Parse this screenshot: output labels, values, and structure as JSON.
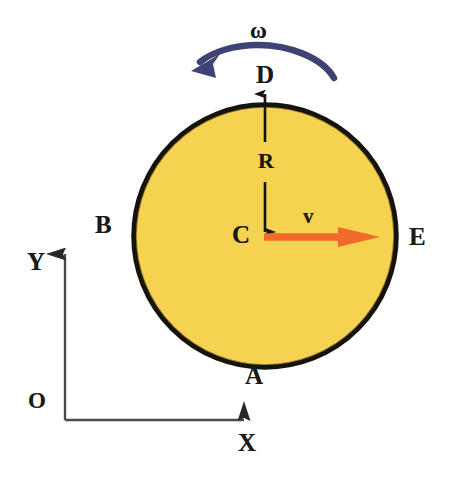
{
  "figure": {
    "background_color": "#ffffff"
  },
  "disk": {
    "name": "rolling-disk",
    "center": {
      "x": 265,
      "y": 236
    },
    "radius": 133,
    "fill_color": "#F5D24F",
    "outline_color": "#16130B",
    "outline_width": 5
  },
  "points": {
    "top": {
      "label": "D",
      "x": 265,
      "y": 89
    },
    "bottom": {
      "label": "A",
      "x": 265,
      "y": 358
    },
    "left": {
      "label": "B",
      "x": 132,
      "y": 236
    },
    "right": {
      "label": "E",
      "x": 398,
      "y": 236
    },
    "center": {
      "label": "C",
      "x": 265,
      "y": 236
    }
  },
  "vectors": {
    "velocity": {
      "label": "v",
      "color": "#F06A2E",
      "from": {
        "x": 265,
        "y": 237
      },
      "to": {
        "x": 378,
        "y": 237
      },
      "direction": "right"
    },
    "angular_velocity": {
      "label": "ω",
      "color": "#3F4373",
      "direction": "counterclockwise",
      "arc_from": {
        "x": 332,
        "y": 74
      },
      "arc_to": {
        "x": 199,
        "y": 68
      }
    },
    "radius_dimension": {
      "label": "R",
      "color": "#16130B",
      "from": {
        "x": 265,
        "y": 236
      },
      "to": {
        "x": 265,
        "y": 90
      },
      "style": "double-headed"
    }
  },
  "axes": {
    "origin_label": "O",
    "x_label": "X",
    "y_label": "Y",
    "color": "#4A4A4F",
    "corner": {
      "x": 65,
      "y": 420
    },
    "x_tip": {
      "x": 262,
      "y": 420
    },
    "y_tip": {
      "x": 65,
      "y": 237
    }
  },
  "labels": {
    "D": "D",
    "A": "A",
    "B": "B",
    "E": "E",
    "C": "C",
    "R": "R",
    "v": "v",
    "omega": "ω",
    "X": "X",
    "Y": "Y",
    "O": "O"
  }
}
